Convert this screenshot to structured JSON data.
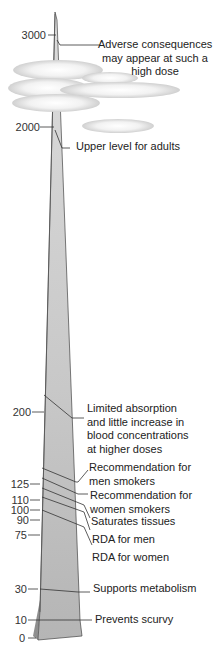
{
  "diagram": {
    "type": "vitamin C intake scale (mg/day)",
    "scale_ticks": [
      {
        "value": "3000",
        "y": 35
      },
      {
        "value": "2000",
        "y": 127
      },
      {
        "value": "200",
        "y": 412
      },
      {
        "value": "125",
        "y": 484
      },
      {
        "value": "110",
        "y": 500
      },
      {
        "value": "100",
        "y": 510
      },
      {
        "value": "90",
        "y": 520
      },
      {
        "value": "75",
        "y": 535
      },
      {
        "value": "30",
        "y": 589
      },
      {
        "value": "10",
        "y": 620
      },
      {
        "value": "0",
        "y": 638
      }
    ],
    "annotations": [
      {
        "id": "adverse",
        "lines": [
          "Adverse consequences",
          "may appear at such a",
          "high dose"
        ]
      },
      {
        "id": "upper",
        "lines": [
          "Upper level for adults"
        ]
      },
      {
        "id": "limited",
        "lines": [
          "Limited absorption",
          "and little increase in",
          "blood concentrations",
          "at higher doses"
        ]
      },
      {
        "id": "men-smokers",
        "lines": [
          "Recommendation for",
          "men smokers"
        ]
      },
      {
        "id": "women-smokers",
        "lines": [
          "Recommendation for",
          "women smokers"
        ]
      },
      {
        "id": "saturates",
        "lines": [
          "Saturates tissues"
        ]
      },
      {
        "id": "rda-men",
        "lines": [
          "RDA for men"
        ]
      },
      {
        "id": "rda-women",
        "lines": [
          "RDA for women"
        ]
      },
      {
        "id": "metabolism",
        "lines": [
          "Supports metabolism"
        ]
      },
      {
        "id": "scurvy",
        "lines": [
          "Prevents scurvy"
        ]
      }
    ],
    "colors": {
      "spike_front": "#c9c9c9",
      "spike_side": "#9a9a9a",
      "outline": "#333333",
      "cloud": "#e6e6e6"
    }
  }
}
